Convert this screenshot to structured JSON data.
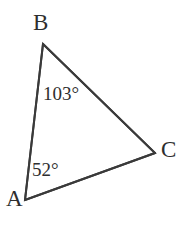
{
  "figure": {
    "type": "triangle-geometry-diagram",
    "background_color": "#ffffff",
    "stroke_color": "#3a3a3a",
    "text_color": "#2e2e2e",
    "stroke_width": 2,
    "canvas": {
      "width": 186,
      "height": 225
    }
  },
  "vertices": {
    "A": {
      "label": "A",
      "x": 25,
      "y": 200
    },
    "B": {
      "label": "B",
      "x": 43,
      "y": 44
    },
    "C": {
      "label": "C",
      "x": 155,
      "y": 153
    }
  },
  "sides": [
    {
      "name": "AB",
      "from": "A",
      "to": "B"
    },
    {
      "name": "BC",
      "from": "B",
      "to": "C"
    },
    {
      "name": "AC",
      "from": "A",
      "to": "C"
    }
  ],
  "angles": {
    "at_B": {
      "value": "103°",
      "vertex": "B"
    },
    "at_A": {
      "value": "52°",
      "vertex": "A"
    }
  }
}
